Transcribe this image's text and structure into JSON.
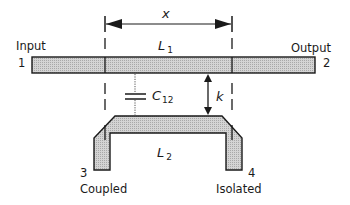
{
  "diagram": {
    "type": "directional-coupler-schematic",
    "length_label": "x",
    "line1": {
      "name": "L",
      "subscript": "1"
    },
    "line2": {
      "name": "L",
      "subscript": "2"
    },
    "capacitance": {
      "name": "C",
      "subscript": "12"
    },
    "coupling_label": "k",
    "ports": {
      "input": {
        "name": "Input",
        "number": "1"
      },
      "output": {
        "name": "Output",
        "number": "2"
      },
      "coupled": {
        "name": "Coupled",
        "number": "3"
      },
      "isolated": {
        "name": "Isolated",
        "number": "4"
      }
    },
    "colors": {
      "line_fill": "#c8c8c8",
      "stroke": "#1a1a1a"
    }
  }
}
